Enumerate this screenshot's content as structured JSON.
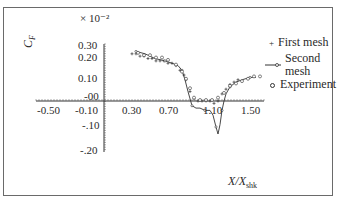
{
  "chart_data": {
    "type": "line",
    "title": "",
    "ylabel": "C_F",
    "ylabel_text": "C",
    "ylabel_sub": "F",
    "y_multiplier": "× 10⁻²",
    "xlabel": "X/X_shk",
    "xlabel_text": "X/X",
    "xlabel_sub": "shk",
    "x_ticks": [
      "-0.50",
      "-0.10",
      "0.30",
      "0.70",
      "1.10",
      "1.50"
    ],
    "y_ticks": [
      "0.30",
      "0.20",
      "0.10",
      "-00",
      "-.10",
      "-.20"
    ],
    "xlim": [
      -0.5,
      1.5
    ],
    "ylim": [
      -0.2,
      0.3
    ],
    "grid": false,
    "legend_position": "right",
    "series": [
      {
        "name": "First mesh",
        "marker": "+",
        "x": [
          0.22,
          0.26,
          0.3,
          0.34,
          0.38,
          0.42,
          0.46,
          0.5,
          0.54,
          0.58,
          0.62,
          0.66,
          0.7,
          0.74,
          0.76,
          0.8,
          0.84,
          0.88,
          0.92,
          0.96,
          1.0,
          1.04,
          1.08,
          1.12,
          1.16,
          1.2,
          1.24,
          1.28
        ],
        "y": [
          0.2,
          0.2,
          0.19,
          0.19,
          0.18,
          0.18,
          0.17,
          0.17,
          0.17,
          0.16,
          0.16,
          0.15,
          0.13,
          0.11,
          0.09,
          0.04,
          0.01,
          0.0,
          0.0,
          0.0,
          0.0,
          -0.01,
          0.0,
          0.03,
          0.05,
          0.07,
          0.08,
          0.09
        ]
      },
      {
        "name": "Second mesh",
        "marker": "line-with-dots",
        "x": [
          0.26,
          0.35,
          0.45,
          0.55,
          0.62,
          0.68,
          0.72,
          0.75,
          0.78,
          0.82,
          0.86,
          0.9,
          0.95,
          1.0,
          1.03,
          1.06,
          1.08,
          1.1,
          1.12,
          1.14,
          1.16,
          1.2,
          1.26,
          1.32,
          1.4,
          1.46
        ],
        "y": [
          0.21,
          0.2,
          0.18,
          0.17,
          0.16,
          0.15,
          0.13,
          0.09,
          0.04,
          -0.02,
          -0.03,
          -0.03,
          -0.04,
          -0.04,
          -0.06,
          -0.11,
          -0.14,
          -0.1,
          -0.04,
          0.0,
          0.03,
          0.06,
          0.08,
          0.09,
          0.1,
          0.1
        ]
      },
      {
        "name": "Experiment",
        "marker": "o",
        "x": [
          0.28,
          0.34,
          0.4,
          0.46,
          0.52,
          0.58,
          0.66,
          0.72,
          0.76,
          0.8,
          0.84,
          0.9,
          0.96,
          1.02,
          1.08,
          1.14,
          1.2,
          1.26,
          1.32,
          1.38,
          1.44,
          1.5
        ],
        "y": [
          0.2,
          0.19,
          0.19,
          0.18,
          0.18,
          0.17,
          0.15,
          0.12,
          0.09,
          0.05,
          0.01,
          0.0,
          0.0,
          0.0,
          0.01,
          0.03,
          0.06,
          0.07,
          0.08,
          0.09,
          0.1,
          0.1
        ]
      }
    ]
  },
  "legend": {
    "first_mesh": "First mesh",
    "second_mesh_line1": "Second",
    "second_mesh_line2": "mesh",
    "experiment": "Experiment"
  }
}
